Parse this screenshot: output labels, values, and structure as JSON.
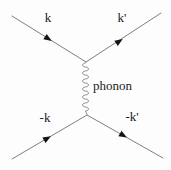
{
  "diagram": {
    "type": "feynman-diagram",
    "labels": {
      "incoming_top": "k",
      "outgoing_top": "k'",
      "propagator": "phonon",
      "incoming_bottom": "-k",
      "outgoing_bottom": "-k'"
    },
    "colors": {
      "line": "#7f7f7f",
      "arrowhead": "#141414",
      "text": "#1a1a1a",
      "background": "#fdfdfd"
    }
  }
}
